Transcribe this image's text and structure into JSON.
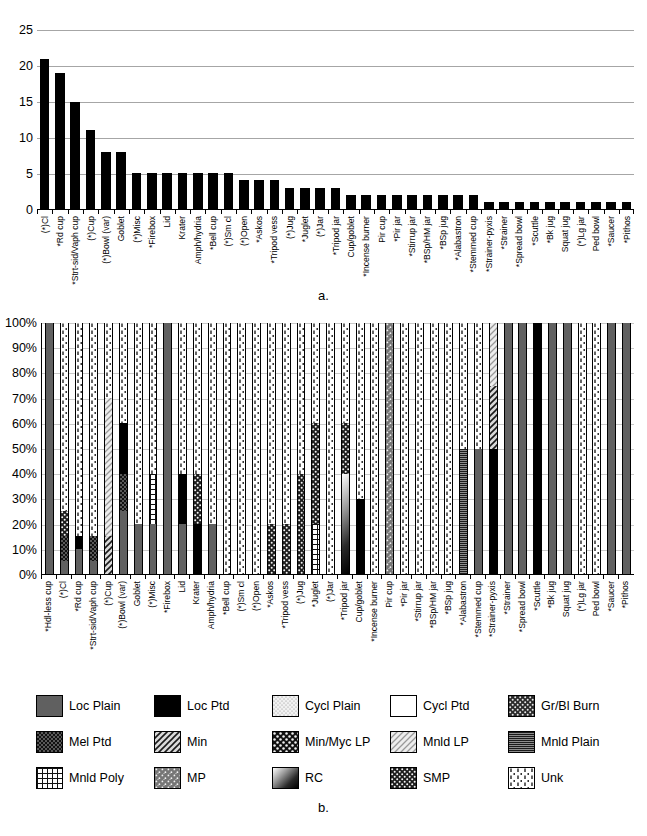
{
  "figure": {
    "caption_a": "a.",
    "caption_b": "b."
  },
  "chart_data": [
    {
      "type": "bar",
      "id": "chart-a",
      "title": "",
      "xlabel": "",
      "ylabel": "",
      "ylim": [
        0,
        25
      ],
      "yticks": [
        "0",
        "5",
        "10",
        "15",
        "20",
        "25"
      ],
      "ytick_values": [
        0,
        5,
        10,
        15,
        20,
        25
      ],
      "grid": true,
      "legend": "none",
      "bar_color": "#000000",
      "categories": [
        "(*)Cl",
        "*Rd cup",
        "*Strt-sid/Vaph cup",
        "(*)Cup",
        "(*)Bowl (var)",
        "Goblet",
        "(*)Misc",
        "*Firebox",
        "Lid",
        "Krater",
        "Amph/hydria",
        "*Bell cup",
        "(*)Sm cl",
        "(*)Open",
        "*Askos",
        "*Tripod vess",
        "(*)Jug",
        "*Juglet",
        "(*)Jar",
        "*Tripod jar",
        "Cup/goblet",
        "*Incense burner",
        "Pir cup",
        "*Pir jar",
        "*Stirrup jar",
        "*BSp/HM jar",
        "*BSp jug",
        "*Alabastron",
        "*Stemmed cup",
        "*Strainer-pyxis",
        "*Strainer",
        "*Spread bowl",
        "*Scuttle",
        "*Bk jug",
        "Squat jug",
        "(*)Lg jar",
        "Ped bowl",
        "*Saucer",
        "*Pithos"
      ],
      "values": [
        21,
        19,
        15,
        11,
        8,
        8,
        5,
        5,
        5,
        5,
        5,
        5,
        5,
        4,
        4,
        4,
        3,
        3,
        3,
        3,
        2,
        2,
        2,
        2,
        2,
        2,
        2,
        2,
        2,
        1,
        1,
        1,
        1,
        1,
        1,
        1,
        1,
        1,
        1
      ]
    },
    {
      "type": "bar",
      "id": "chart-b",
      "subtype": "stacked-100",
      "title": "",
      "xlabel": "",
      "ylabel": "",
      "ylim": [
        0,
        100
      ],
      "yticks": [
        "0%",
        "10%",
        "20%",
        "30%",
        "40%",
        "50%",
        "60%",
        "70%",
        "80%",
        "90%",
        "100%"
      ],
      "ytick_values": [
        0,
        10,
        20,
        30,
        40,
        50,
        60,
        70,
        80,
        90,
        100
      ],
      "grid": true,
      "legend_position": "bottom",
      "categories": [
        "*Hdl-less cup",
        "(*)Cl",
        "*Rd cup",
        "*Strt-sid/Vaph cup",
        "(*)Cup",
        "(*)Bowl (var)",
        "Goblet",
        "(*)Misc",
        "*Firebox",
        "Lid",
        "Krater",
        "Amph/hydria",
        "*Bell cup",
        "(*)Sm cl",
        "(*)Open",
        "*Askos",
        "*Tripod vess",
        "(*)Jug",
        "*Juglet",
        "(*)Jar",
        "*Tripod jar",
        "Cup/goblet",
        "*Incense burner",
        "Pir cup",
        "*Pir jar",
        "*Stirrup jar",
        "*BSp/HM jar",
        "*BSp jug",
        "*Alabastron",
        "*Stemmed cup",
        "*Strainer-pyxis",
        "*Strainer",
        "*Spread bowl",
        "*Scuttle",
        "*Bk jug",
        "Squat jug",
        "(*)Lg jar",
        "Ped bowl",
        "*Saucer",
        "*Pithos"
      ],
      "series": [
        {
          "name": "Loc Plain",
          "values": [
            100,
            5,
            10,
            5,
            0,
            25,
            20,
            20,
            100,
            20,
            0,
            20,
            0,
            0,
            0,
            0,
            0,
            0,
            0,
            0,
            0,
            0,
            0,
            0,
            0,
            0,
            0,
            0,
            0,
            50,
            0,
            100,
            100,
            0,
            100,
            100,
            0,
            0,
            100,
            100
          ]
        },
        {
          "name": "Mel Ptd",
          "values": [
            0,
            10,
            0,
            10,
            0,
            15,
            0,
            0,
            0,
            0,
            0,
            0,
            0,
            0,
            0,
            0,
            0,
            0,
            0,
            0,
            0,
            0,
            0,
            0,
            0,
            0,
            0,
            0,
            0,
            0,
            0,
            0,
            0,
            0,
            0,
            0,
            0,
            0,
            0,
            0
          ]
        },
        {
          "name": "Mnld Poly",
          "values": [
            0,
            0,
            0,
            0,
            0,
            0,
            0,
            20,
            0,
            0,
            0,
            0,
            0,
            0,
            0,
            0,
            0,
            0,
            20,
            0,
            0,
            0,
            0,
            0,
            0,
            0,
            0,
            0,
            0,
            0,
            0,
            0,
            0,
            0,
            0,
            0,
            0,
            0,
            0,
            0
          ]
        },
        {
          "name": "Loc Ptd",
          "values": [
            0,
            0,
            5,
            0,
            0,
            20,
            0,
            0,
            0,
            20,
            20,
            0,
            0,
            0,
            0,
            0,
            0,
            0,
            0,
            0,
            0,
            30,
            0,
            0,
            0,
            0,
            0,
            0,
            0,
            0,
            50,
            0,
            0,
            100,
            0,
            0,
            0,
            0,
            0,
            0
          ]
        },
        {
          "name": "Min",
          "values": [
            0,
            0,
            0,
            0,
            15,
            0,
            0,
            0,
            0,
            0,
            0,
            0,
            0,
            0,
            0,
            0,
            0,
            0,
            0,
            0,
            0,
            0,
            0,
            0,
            0,
            0,
            0,
            0,
            0,
            0,
            25,
            0,
            0,
            0,
            0,
            0,
            0,
            0,
            0,
            0
          ]
        },
        {
          "name": "Min/Myc LP",
          "values": [
            0,
            0,
            0,
            0,
            0,
            0,
            0,
            0,
            0,
            0,
            0,
            0,
            0,
            0,
            0,
            0,
            0,
            0,
            0,
            0,
            0,
            0,
            0,
            0,
            0,
            0,
            0,
            0,
            0,
            0,
            0,
            0,
            0,
            0,
            0,
            0,
            0,
            0,
            0,
            0
          ]
        },
        {
          "name": "Mnld LP",
          "values": [
            0,
            0,
            0,
            0,
            55,
            0,
            0,
            0,
            0,
            0,
            0,
            0,
            0,
            0,
            0,
            0,
            0,
            0,
            0,
            0,
            0,
            0,
            0,
            0,
            0,
            0,
            0,
            0,
            0,
            0,
            25,
            0,
            0,
            0,
            0,
            0,
            0,
            0,
            0,
            0
          ]
        },
        {
          "name": "Mnld Plain",
          "values": [
            0,
            0,
            0,
            0,
            0,
            0,
            0,
            0,
            0,
            0,
            0,
            0,
            0,
            0,
            0,
            0,
            0,
            0,
            0,
            0,
            0,
            0,
            0,
            0,
            0,
            0,
            0,
            0,
            50,
            0,
            0,
            0,
            0,
            0,
            0,
            0,
            0,
            0,
            0,
            0
          ]
        },
        {
          "name": "MP",
          "values": [
            0,
            0,
            0,
            0,
            0,
            0,
            0,
            0,
            0,
            0,
            0,
            0,
            0,
            0,
            0,
            0,
            0,
            0,
            0,
            0,
            0,
            0,
            0,
            100,
            0,
            0,
            0,
            0,
            0,
            0,
            0,
            0,
            0,
            0,
            0,
            0,
            0,
            0,
            0,
            0
          ]
        },
        {
          "name": "RC",
          "values": [
            0,
            0,
            0,
            0,
            0,
            0,
            0,
            0,
            0,
            0,
            0,
            0,
            0,
            0,
            0,
            0,
            0,
            0,
            0,
            0,
            40,
            0,
            0,
            0,
            0,
            0,
            0,
            0,
            0,
            0,
            0,
            0,
            0,
            0,
            0,
            0,
            0,
            0,
            0,
            0
          ]
        },
        {
          "name": "SMP",
          "values": [
            0,
            10,
            0,
            0,
            0,
            0,
            0,
            0,
            0,
            0,
            20,
            0,
            0,
            0,
            0,
            20,
            20,
            40,
            40,
            0,
            20,
            0,
            0,
            0,
            0,
            0,
            0,
            0,
            0,
            0,
            0,
            0,
            0,
            0,
            0,
            0,
            0,
            0,
            0,
            0
          ]
        },
        {
          "name": "Cycl Plain",
          "values": [
            0,
            0,
            0,
            0,
            0,
            0,
            0,
            0,
            0,
            0,
            0,
            0,
            0,
            0,
            0,
            0,
            0,
            0,
            0,
            0,
            0,
            0,
            0,
            0,
            0,
            0,
            0,
            0,
            0,
            0,
            0,
            0,
            0,
            0,
            0,
            0,
            0,
            0,
            0,
            0
          ]
        },
        {
          "name": "Cycl Ptd",
          "values": [
            0,
            0,
            0,
            0,
            0,
            0,
            0,
            0,
            0,
            0,
            0,
            0,
            0,
            0,
            0,
            0,
            0,
            0,
            0,
            0,
            0,
            0,
            0,
            0,
            0,
            0,
            0,
            0,
            0,
            0,
            0,
            0,
            0,
            0,
            0,
            0,
            0,
            0,
            0,
            0
          ]
        },
        {
          "name": "Gr/Bl Burn",
          "values": [
            0,
            0,
            0,
            0,
            0,
            0,
            0,
            0,
            0,
            0,
            0,
            0,
            0,
            0,
            0,
            0,
            0,
            0,
            0,
            0,
            0,
            0,
            0,
            0,
            0,
            0,
            0,
            0,
            0,
            0,
            0,
            0,
            0,
            0,
            0,
            0,
            0,
            0,
            0,
            0
          ]
        },
        {
          "name": "Unk",
          "values": [
            0,
            75,
            85,
            85,
            30,
            40,
            80,
            60,
            0,
            60,
            60,
            80,
            100,
            100,
            100,
            80,
            80,
            60,
            40,
            100,
            40,
            70,
            100,
            0,
            100,
            100,
            100,
            100,
            50,
            50,
            0,
            0,
            0,
            0,
            0,
            0,
            100,
            100,
            0,
            0
          ]
        }
      ]
    }
  ],
  "legend": {
    "items": [
      {
        "label": "Loc Plain",
        "pattern": "solid-gray"
      },
      {
        "label": "Loc Ptd",
        "pattern": "solid-black"
      },
      {
        "label": "Cycl Plain",
        "pattern": "fine-stipple"
      },
      {
        "label": "Cycl Ptd",
        "pattern": "white"
      },
      {
        "label": "Gr/Bl Burn",
        "pattern": "coarse-speckle"
      },
      {
        "label": "Mel Ptd",
        "pattern": "dark-dot"
      },
      {
        "label": "Min",
        "pattern": "diag-hatch"
      },
      {
        "label": "Min/Myc LP",
        "pattern": "checker-dot"
      },
      {
        "label": "Mnld LP",
        "pattern": "light-diag"
      },
      {
        "label": "Mnld Plain",
        "pattern": "horiz-lines"
      },
      {
        "label": "Mnld Poly",
        "pattern": "grid"
      },
      {
        "label": "MP",
        "pattern": "gray-stipple"
      },
      {
        "label": "RC",
        "pattern": "gradient"
      },
      {
        "label": "SMP",
        "pattern": "dense-dot"
      },
      {
        "label": "Unk",
        "pattern": "white-dash"
      }
    ]
  }
}
